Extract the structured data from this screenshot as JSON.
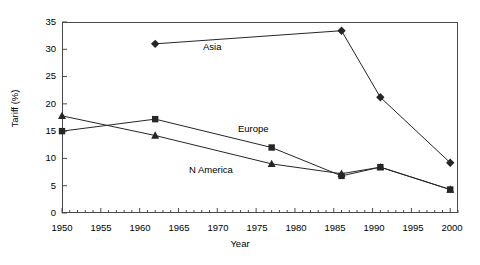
{
  "chart_data": {
    "type": "line",
    "title": "",
    "xlabel": "Year",
    "ylabel": "Tariff (%)",
    "xlim": [
      1950,
      2001
    ],
    "ylim": [
      0,
      35
    ],
    "xticks": [
      1950,
      1955,
      1960,
      1965,
      1970,
      1975,
      1980,
      1985,
      1990,
      1995,
      2000
    ],
    "yticks": [
      0,
      5,
      10,
      15,
      20,
      25,
      30,
      35
    ],
    "minor_xtick_interval": 1,
    "grid": false,
    "legend": "inline-labels",
    "series": [
      {
        "name": "Asia",
        "marker": "diamond",
        "x": [
          1962,
          1986,
          1991,
          2000
        ],
        "y": [
          31,
          33.4,
          21.2,
          9.2
        ]
      },
      {
        "name": "Europe",
        "marker": "square",
        "x": [
          1950,
          1962,
          1977,
          1986,
          1991,
          2000
        ],
        "y": [
          15,
          17.2,
          12,
          6.8,
          8.4,
          4.3
        ]
      },
      {
        "name": "N America",
        "marker": "triangle",
        "x": [
          1950,
          1962,
          1977,
          1986,
          1991,
          2000
        ],
        "y": [
          17.8,
          14.2,
          9,
          7.2,
          8.4,
          4.3
        ]
      }
    ],
    "annotations": [
      {
        "text": "Asia",
        "x": 1973,
        "y": 30.3
      },
      {
        "text": "Europe",
        "x": 1977.5,
        "y": 15.2
      },
      {
        "text": "N America",
        "x": 1971,
        "y": 7.8
      }
    ]
  },
  "axis": {
    "y_tick_labels": [
      "0",
      "5",
      "10",
      "15",
      "20",
      "25",
      "30",
      "35"
    ],
    "x_tick_labels": [
      "1950",
      "1955",
      "1960",
      "1965",
      "1970",
      "1975",
      "1980",
      "1985",
      "1990",
      "1995",
      "2000"
    ],
    "ylabel_text": "Tariff (%)",
    "xlabel_text": "Year"
  },
  "labels": {
    "asia": "Asia",
    "europe": "Europe",
    "namerica": "N America"
  },
  "colors": {
    "line": "#262626",
    "frame": "#4a4a4a",
    "text": "#000000",
    "background": "#ffffff"
  }
}
